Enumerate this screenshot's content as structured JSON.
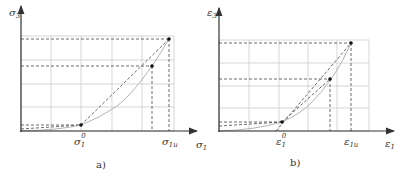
{
  "panels": [
    {
      "id": "a",
      "caption": "a)",
      "y_axis_label": "σ3",
      "x_axis_label": "σ1",
      "tick_labels": {
        "start": "σ1⁰",
        "end": "σ1u"
      },
      "tick_start_sym": "σ",
      "tick_start_sub": "1",
      "tick_start_sup": "0",
      "tick_end_sym": "σ",
      "tick_end_sub": "1u",
      "y_sym": "σ",
      "y_sub": "3",
      "x_sym": "σ",
      "x_sub": "1"
    },
    {
      "id": "b",
      "caption": "b)",
      "y_axis_label": "ε3",
      "x_axis_label": "ε1",
      "tick_labels": {
        "start": "ε1⁰",
        "end": "ε1u"
      },
      "tick_start_sym": "ε",
      "tick_start_sub": "1",
      "tick_start_sup": "0",
      "tick_end_sym": "ε",
      "tick_end_sub": "1u",
      "y_sym": "ε",
      "y_sub": "3",
      "x_sym": "ε",
      "x_sub": "1"
    }
  ],
  "colors": {
    "axis": "#333333",
    "grid": "#bbbbbb",
    "dash": "#444444",
    "curve": "#aaaaaa"
  }
}
